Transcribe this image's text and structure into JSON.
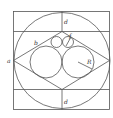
{
  "diagram": {
    "labels": {
      "a": "a",
      "b": "b",
      "d_top": "d",
      "d_bottom": "d",
      "f": "f",
      "R": "R"
    },
    "colors": {
      "stroke": "#555555",
      "background": "#ffffff"
    }
  }
}
